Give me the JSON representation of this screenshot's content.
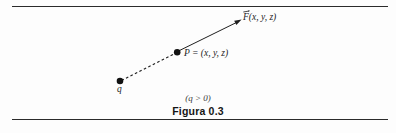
{
  "figure": {
    "background_color": "#fdfdfd",
    "ink_color": "#1c1c1c",
    "rule_color": "#2b2b2b",
    "caption": "Figura 0.3",
    "condition_note": "(q > 0)",
    "labels": {
      "field_vector": "F(x, y, z)",
      "point": "P = (x, y, z)",
      "charge": "q"
    },
    "geometry": {
      "charge_point": {
        "x": 120,
        "y": 81
      },
      "field_point": {
        "x": 177,
        "y": 52
      },
      "arrow_tip": {
        "x": 241,
        "y": 20
      },
      "dashed_segment": "from charge q to point P",
      "solid_segment": "from point P to arrow tip, arrowheaded"
    },
    "rules": {
      "top_y": 6,
      "bottom_y": 119,
      "left_x": 12,
      "right_x": 388
    }
  }
}
